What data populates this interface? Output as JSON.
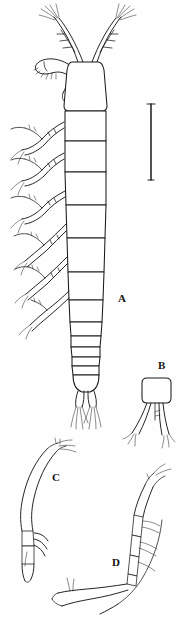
{
  "figure": {
    "type": "scientific-line-drawing",
    "background_color": "#ffffff",
    "ink_color": "#1a1a1a",
    "width_px": 178,
    "height_px": 626
  },
  "panels": [
    {
      "id": "A",
      "label": "A",
      "label_x": 118,
      "label_y": 302,
      "description": "whole animal, dorsal view: antennules, cephalothorax, five thoracic somites with paired swimming legs, segmented urosome, caudal rami with setae"
    },
    {
      "id": "B",
      "label": "B",
      "label_x": 158,
      "label_y": 369,
      "description": "isolated appendage with rounded-rectangular basal segment and two long splayed rami bearing setae"
    },
    {
      "id": "C",
      "label": "C",
      "label_x": 52,
      "label_y": 481,
      "description": "curved elongate appendage with segmented distal portion and terminal claws"
    },
    {
      "id": "D",
      "label": "D",
      "label_x": 112,
      "label_y": 566,
      "description": "curved multi-segmented appendage with lateral setae along inner margin"
    }
  ],
  "scale_bar": {
    "name": "scale-bar",
    "orientation": "vertical",
    "x": 151,
    "y_top": 104,
    "y_bottom": 180,
    "caption": ""
  }
}
